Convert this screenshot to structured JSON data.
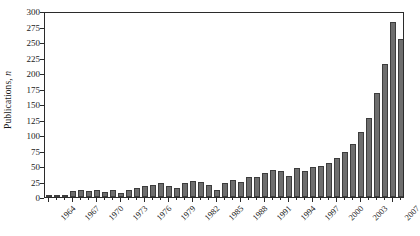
{
  "chart_data": {
    "type": "bar",
    "title": "",
    "subtitle": "",
    "xlabel": "",
    "ylabel": "Publications, n",
    "ylabel_parts": {
      "text": "Publications, ",
      "italic": "n"
    },
    "ylim": [
      0,
      300
    ],
    "ytick_step": 25,
    "yticks": [
      0,
      25,
      50,
      75,
      100,
      125,
      150,
      175,
      200,
      225,
      250,
      275,
      300
    ],
    "ytick_labels": [
      "0",
      "25",
      "50",
      "75",
      "100",
      "125",
      "150",
      "175",
      "200",
      "225",
      "250",
      "275",
      "300"
    ],
    "xlim_categories": [
      "1964",
      "2008"
    ],
    "xtick_labels": [
      "1964",
      "1967",
      "1970",
      "1973",
      "1976",
      "1979",
      "1982",
      "1985",
      "1988",
      "1991",
      "1994",
      "1997",
      "2000",
      "2003",
      "2007"
    ],
    "xtick_label_every": 3,
    "grid": false,
    "legend": null,
    "legend_position": "none",
    "bar_color": "#6e6e6e",
    "bar_edge_color": "#3d3d3d",
    "frame_color": "#2b2b2b",
    "categories": [
      "1964",
      "1965",
      "1966",
      "1967",
      "1968",
      "1969",
      "1970",
      "1971",
      "1972",
      "1973",
      "1974",
      "1975",
      "1976",
      "1977",
      "1978",
      "1979",
      "1980",
      "1981",
      "1982",
      "1983",
      "1984",
      "1985",
      "1986",
      "1987",
      "1988",
      "1989",
      "1990",
      "1991",
      "1992",
      "1993",
      "1994",
      "1995",
      "1996",
      "1997",
      "1998",
      "1999",
      "2000",
      "2001",
      "2002",
      "2003",
      "2004",
      "2005",
      "2006",
      "2007",
      "2008"
    ],
    "values": [
      2,
      2,
      3,
      10,
      11,
      9,
      12,
      8,
      11,
      6,
      11,
      14,
      18,
      20,
      22,
      18,
      15,
      22,
      26,
      24,
      20,
      12,
      22,
      27,
      25,
      32,
      32,
      38,
      44,
      42,
      34,
      46,
      42,
      48,
      50,
      55,
      63,
      73,
      86,
      105,
      128,
      168,
      215,
      282,
      255
    ]
  }
}
